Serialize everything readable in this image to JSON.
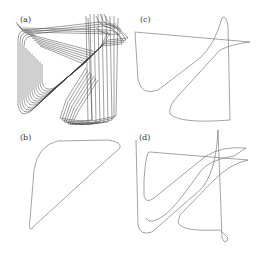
{
  "figure": {
    "panels": [
      {
        "id": "a",
        "label": "(a)",
        "description": "chaotic attractor, dense trajectories"
      },
      {
        "id": "b",
        "label": "(b)",
        "description": "period-1 limit cycle"
      },
      {
        "id": "c",
        "label": "(c)",
        "description": "period-2 limit cycle"
      },
      {
        "id": "d",
        "label": "(d)",
        "description": "period-3 limit cycle"
      }
    ],
    "stroke_color": "#555555",
    "dense_stroke_color": "#222222"
  }
}
